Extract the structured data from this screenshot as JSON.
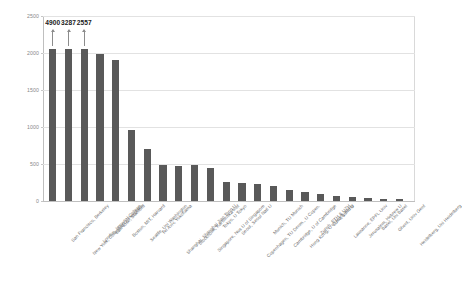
{
  "chart_data": {
    "type": "bar",
    "title": "",
    "subtitle": "",
    "xlabel": "",
    "ylabel": "",
    "ylim": [
      0,
      2500
    ],
    "yticks": [
      0,
      500,
      1000,
      1500,
      2000,
      2500
    ],
    "ytick_labels": [
      "0",
      "500",
      "1000",
      "1500",
      "2000",
      "2500"
    ],
    "grid": true,
    "legend": null,
    "bar_color": "#595959",
    "clipped_note": "First three bars exceed the axis maximum and are truncated at the top of the plot; their true values are printed above with upward arrows.",
    "categories": [
      "San Francisco, Berkeley",
      "New York, Columbia U, Princeton",
      "London, Imperial College",
      "San Jose, Stanford",
      "Boston, MIT, Harvard",
      "Seattle, Uni Washington",
      "Tel Aviv, Yokohama",
      "Shanghai, Shanghai Jiao Tong U",
      "Stockholm, Karolinska Inst",
      "Singapore, Nus U of Singapore",
      "Tokyo, U Tokyo",
      "Seoul, Seoul Natl U",
      "Copenhagen, TU Denm., U Copen.",
      "Munich, TU Munich",
      "Cambridge, U of Cambridge",
      "Hong Kong, U of Hong Kong",
      "Zurich, ETH & UZH",
      "Lund, Lund U",
      "Lausanne, EPFL Univ",
      "Jerusalem, Hebrew U",
      "Basel, Uni Basel",
      "Ghent, Univ Gent",
      "Heidelberg, Uni Heidelberg"
    ],
    "values": [
      4900,
      3287,
      2557,
      1980,
      1900,
      960,
      700,
      490,
      470,
      480,
      440,
      260,
      250,
      230,
      200,
      150,
      120,
      95,
      70,
      55,
      40,
      30,
      22
    ],
    "displayed_values": [
      2060,
      2060,
      2060,
      1980,
      1900,
      960,
      700,
      490,
      470,
      480,
      440,
      260,
      250,
      230,
      200,
      150,
      120,
      95,
      70,
      55,
      40,
      30,
      22
    ],
    "annotations": [
      {
        "index": 0,
        "label": "4900",
        "arrow": "up"
      },
      {
        "index": 1,
        "label": "3287",
        "arrow": "up"
      },
      {
        "index": 2,
        "label": "2557",
        "arrow": "up"
      }
    ]
  }
}
